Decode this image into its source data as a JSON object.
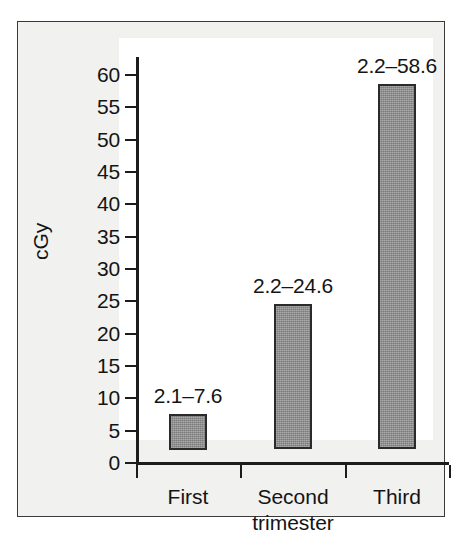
{
  "chart_data": {
    "type": "bar",
    "title": "",
    "subtitle": "",
    "xlabel": "trimester",
    "ylabel": "cGy",
    "categories": [
      "First",
      "Second",
      "Third"
    ],
    "category_sublabel": "trimester",
    "series": [
      {
        "name": "Estimated fetal dose range",
        "low_values": [
          2.1,
          2.2,
          2.2
        ],
        "high_values": [
          7.6,
          24.6,
          58.6
        ]
      }
    ],
    "values": [
      7.6,
      24.6,
      58.6
    ],
    "data_labels": [
      "2.1–7.6",
      "2.2–24.6",
      "2.2–58.6"
    ],
    "ylim": [
      0,
      62
    ],
    "y_ticks": [
      0,
      5,
      10,
      15,
      20,
      25,
      30,
      35,
      40,
      45,
      50,
      55,
      60
    ],
    "y_tick_labels": [
      "0",
      "5",
      "10",
      "15",
      "20",
      "25",
      "30",
      "35",
      "40",
      "45",
      "50",
      "55",
      "60"
    ],
    "grid": false,
    "legend": false,
    "legend_position": "none",
    "bar_fill_color": "#8a8a8a",
    "bar_border_color": "#2a2a2a",
    "plot_background": "#ffffff",
    "figure_background": "#f1f1ef",
    "axis_color": "#1c1c1c",
    "text_color": "#141414"
  },
  "axis": {
    "y_title": "cGy"
  },
  "bars": [
    {
      "label": "2.1–7.6",
      "category": "First",
      "low": 2.1,
      "high": 7.6
    },
    {
      "label": "2.2–24.6",
      "category": "Second",
      "low": 2.2,
      "high": 24.6
    },
    {
      "label": "2.2–58.6",
      "category": "Third",
      "low": 2.2,
      "high": 58.6
    }
  ],
  "categories": [
    {
      "label": "First",
      "sublabel": ""
    },
    {
      "label": "Second",
      "sublabel": "trimester"
    },
    {
      "label": "Third",
      "sublabel": ""
    }
  ],
  "y_ticks": [
    {
      "label": "60"
    },
    {
      "label": "55"
    },
    {
      "label": "50"
    },
    {
      "label": "45"
    },
    {
      "label": "40"
    },
    {
      "label": "35"
    },
    {
      "label": "30"
    },
    {
      "label": "25"
    },
    {
      "label": "20"
    },
    {
      "label": "15"
    },
    {
      "label": "10"
    },
    {
      "label": "5"
    },
    {
      "label": "0"
    }
  ]
}
